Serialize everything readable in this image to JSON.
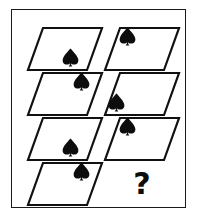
{
  "figure": {
    "type": "visual-analogy-matrix",
    "background_color": "#ffffff",
    "ink_color": "#0d0d0d",
    "frame": {
      "shape": "rectangle",
      "stroke_color": "#1a1a1a",
      "x": 11,
      "y": 9,
      "width": 175,
      "height": 199
    },
    "grid": {
      "columns": 2,
      "rows": 4
    }
  },
  "shapes": {
    "container_name": "parallelogram",
    "glyph_name": "spade-glyph",
    "glyph_color": "#0d0d0d",
    "glyph_outline_color": "#111111"
  },
  "cells": [
    {
      "id": "cell-r1c1",
      "row": 1,
      "column": 1,
      "container": "parallelogram",
      "glyph": "spade",
      "glyph_position": "bottom-right",
      "x": 26,
      "y": 26,
      "label": "row 1 left"
    },
    {
      "id": "cell-r1c2",
      "row": 1,
      "column": 2,
      "container": "parallelogram",
      "glyph": "spade",
      "glyph_position": "top-left",
      "x": 103,
      "y": 26,
      "label": "row 1 right"
    },
    {
      "id": "cell-r2c1",
      "row": 2,
      "column": 1,
      "container": "parallelogram",
      "glyph": "spade",
      "glyph_position": "top-right",
      "x": 26,
      "y": 71,
      "label": "row 2 left"
    },
    {
      "id": "cell-r2c2",
      "row": 2,
      "column": 2,
      "container": "parallelogram",
      "glyph": "spade",
      "glyph_position": "bottom-left",
      "x": 103,
      "y": 71,
      "label": "row 2 right"
    },
    {
      "id": "cell-r3c1",
      "row": 3,
      "column": 1,
      "container": "parallelogram",
      "glyph": "spade",
      "glyph_position": "bottom-right",
      "x": 26,
      "y": 116,
      "label": "row 3 left"
    },
    {
      "id": "cell-r3c2",
      "row": 3,
      "column": 2,
      "container": "parallelogram",
      "glyph": "spade",
      "glyph_position": "top-left",
      "x": 103,
      "y": 116,
      "label": "row 3 right"
    },
    {
      "id": "cell-r4c1",
      "row": 4,
      "column": 1,
      "container": "parallelogram",
      "glyph": "spade",
      "glyph_position": "top-right",
      "x": 26,
      "y": 161,
      "label": "row 4 left"
    },
    {
      "id": "cell-r4c2",
      "row": 4,
      "column": 2,
      "container": "none",
      "glyph": "question-mark",
      "glyph_position": "center",
      "x": 103,
      "y": 161,
      "label": "row 4 right answer slot"
    }
  ],
  "answer_slot": {
    "text": "?",
    "name": "question-mark"
  }
}
